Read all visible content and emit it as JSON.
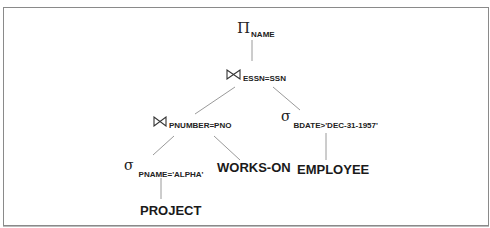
{
  "diagram": {
    "type": "query-tree",
    "colors": {
      "line": "#9a9a9a",
      "text": "#1a1a1a",
      "border": "#8a8a8a"
    },
    "nodes": {
      "project": {
        "operator": "Π",
        "operator_name": "projection",
        "subscript": "NAME"
      },
      "join_top": {
        "operator": "⋈",
        "operator_name": "join",
        "subscript": "ESSN=SSN"
      },
      "join_left": {
        "operator": "⋈",
        "operator_name": "join",
        "subscript": "PNUMBER=PNO"
      },
      "select_bdate": {
        "operator": "σ",
        "operator_name": "selection",
        "subscript": "BDATE>'DEC-31-1957'"
      },
      "select_pname": {
        "operator": "σ",
        "operator_name": "selection",
        "subscript": "PNAME='ALPHA'"
      },
      "rel_works_on": {
        "label": "WORKS-ON"
      },
      "rel_employee": {
        "label": "EMPLOYEE"
      },
      "rel_project": {
        "label": "PROJECT"
      }
    },
    "edges": [
      {
        "from": "project",
        "to": "join_top"
      },
      {
        "from": "join_top",
        "to": "join_left"
      },
      {
        "from": "join_top",
        "to": "select_bdate"
      },
      {
        "from": "join_left",
        "to": "select_pname"
      },
      {
        "from": "join_left",
        "to": "rel_works_on"
      },
      {
        "from": "select_bdate",
        "to": "rel_employee"
      },
      {
        "from": "select_pname",
        "to": "rel_project"
      }
    ]
  }
}
